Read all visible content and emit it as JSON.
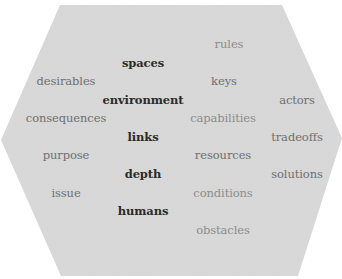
{
  "diagram": {
    "type": "word-cloud",
    "shape": "hexagon",
    "colors": {
      "background": "#d9d9d9",
      "strong": "#2b2b2b",
      "mid": "#6f6f6f",
      "light": "#8c8c8c"
    },
    "words": [
      {
        "text": "rules",
        "tone": "light"
      },
      {
        "text": "spaces",
        "tone": "strong"
      },
      {
        "text": "desirables",
        "tone": "mid"
      },
      {
        "text": "keys",
        "tone": "mid"
      },
      {
        "text": "environment",
        "tone": "strong"
      },
      {
        "text": "actors",
        "tone": "mid"
      },
      {
        "text": "consequences",
        "tone": "mid"
      },
      {
        "text": "capabilities",
        "tone": "light"
      },
      {
        "text": "links",
        "tone": "strong"
      },
      {
        "text": "tradeoffs",
        "tone": "mid"
      },
      {
        "text": "purpose",
        "tone": "mid"
      },
      {
        "text": "resources",
        "tone": "mid"
      },
      {
        "text": "depth",
        "tone": "strong"
      },
      {
        "text": "solutions",
        "tone": "mid"
      },
      {
        "text": "issue",
        "tone": "mid"
      },
      {
        "text": "conditions",
        "tone": "light"
      },
      {
        "text": "humans",
        "tone": "strong"
      },
      {
        "text": "obstacles",
        "tone": "light"
      }
    ]
  }
}
